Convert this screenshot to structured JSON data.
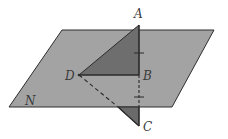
{
  "figure": {
    "type": "geometry-3d-plane-perpendicular",
    "colors": {
      "plane_fill": "#a3a3a3",
      "plane_stroke": "#2e2e2e",
      "triangle_upper_fill": "#6e6e6e",
      "triangle_lower_fill": "#6a6a6a",
      "line_color": "#2a2a2a",
      "background": "#ffffff"
    },
    "plane": {
      "label": "N",
      "points": "62,30 214,30 172,107 9,107"
    },
    "points": {
      "A": {
        "label": "A",
        "x": 139,
        "y": 25
      },
      "B": {
        "label": "B",
        "x": 139,
        "y": 75
      },
      "C": {
        "label": "C",
        "x": 139,
        "y": 126
      },
      "D": {
        "label": "D",
        "x": 79,
        "y": 75
      }
    },
    "labels": {
      "A": "A",
      "B": "B",
      "C": "C",
      "D": "D",
      "N": "N"
    },
    "tick_marks": [
      {
        "segment": "AB",
        "x": 139,
        "y": 53
      },
      {
        "segment": "BC",
        "x": 139,
        "y": 97
      }
    ]
  }
}
